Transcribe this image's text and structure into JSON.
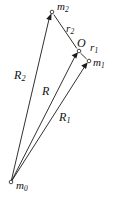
{
  "figure": {
    "type": "vector-diagram",
    "background_color": "#ffffff",
    "line_color": "#1a1a1a",
    "width": 115,
    "height": 198
  },
  "nodes": [
    {
      "id": "m0",
      "label_base": "m",
      "label_sub": "0",
      "x": 11,
      "y": 182,
      "label_x": 16,
      "label_y": 180
    },
    {
      "id": "m2",
      "label_base": "m",
      "label_sub": "2",
      "x": 52,
      "y": 12,
      "label_x": 57,
      "label_y": 2
    },
    {
      "id": "O",
      "label_base": "O",
      "label_sub": "",
      "x": 79,
      "y": 51,
      "label_x": 78,
      "label_y": 38
    },
    {
      "id": "m1",
      "label_base": "m",
      "label_sub": "1",
      "x": 89,
      "y": 61,
      "label_x": 93,
      "label_y": 58
    }
  ],
  "vectors": [
    {
      "id": "R2",
      "label_base": "R",
      "label_sub": "2",
      "from": "m0",
      "to": "m2",
      "label_x": 15,
      "label_y": 70
    },
    {
      "id": "R",
      "label_base": "R",
      "label_sub": "",
      "from": "m0",
      "to": "O",
      "label_x": 42,
      "label_y": 86
    },
    {
      "id": "R1",
      "label_base": "R",
      "label_sub": "1",
      "from": "m0",
      "to": "m1",
      "label_x": 59,
      "label_y": 112
    },
    {
      "id": "r2",
      "label_base": "r",
      "label_sub": "2",
      "from": "m2",
      "to": "O",
      "label_x": 66,
      "label_y": 24
    },
    {
      "id": "r1",
      "label_base": "r",
      "label_sub": "1",
      "from": "O",
      "to": "m1",
      "label_x": 90,
      "label_y": 43
    }
  ]
}
